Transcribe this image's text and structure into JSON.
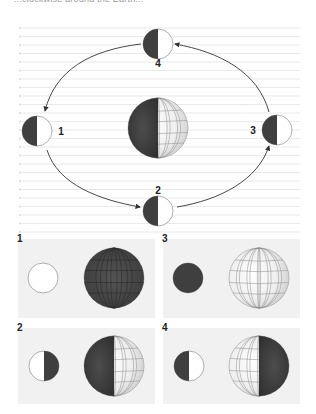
{
  "header": {
    "partial_text": "...clockwise around the Earth..."
  },
  "diagram": {
    "orbit_direction": "counterclockwise",
    "positions": [
      {
        "id": "1",
        "label": "1",
        "location": "left",
        "lit_side": "right"
      },
      {
        "id": "2",
        "label": "2",
        "location": "bottom",
        "lit_side": "right"
      },
      {
        "id": "3",
        "label": "3",
        "location": "right",
        "lit_side": "right"
      },
      {
        "id": "4",
        "label": "4",
        "location": "top",
        "lit_side": "right"
      }
    ],
    "earth": {
      "lit_side": "right"
    }
  },
  "panels": [
    {
      "label": "1",
      "moon_view": "full",
      "earth_view": "new"
    },
    {
      "label": "3",
      "moon_view": "new",
      "earth_view": "full"
    },
    {
      "label": "2",
      "moon_view": "first-quarter-left-lit",
      "earth_view": "half-left-dark"
    },
    {
      "label": "4",
      "moon_view": "half-right-lit",
      "earth_view": "half-right-dark"
    }
  ],
  "colors": {
    "dark": "#3f3f3f",
    "light": "#ffffff",
    "earth_light": "#e6e6e6",
    "line": "#e3e3e3",
    "panel_bg": "#f1f1f1",
    "stroke": "#555555"
  }
}
